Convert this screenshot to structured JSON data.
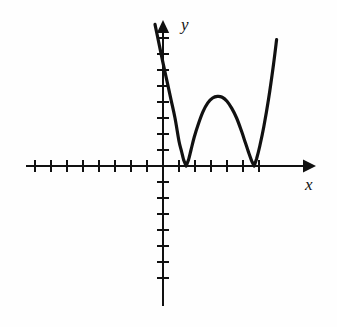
{
  "figure": {
    "title": "",
    "background_color": "#fefefe",
    "ink_color": "#111111",
    "width": 337,
    "height": 327
  },
  "labels": {
    "x_axis": "x",
    "y_axis": "y"
  },
  "axes": {
    "origin_px": {
      "x": 163,
      "y": 166
    },
    "tick_spacing_px": 16,
    "tick_half_length_px": 6,
    "x_axis": {
      "start_px": 26,
      "end_px": 312,
      "arrow": "right",
      "ticks_left_of_origin": 8,
      "ticks_right_of_origin": 6,
      "line_width_px": 2
    },
    "y_axis": {
      "top_px": 22,
      "bottom_px": 306,
      "arrow": "up",
      "ticks_above_origin": 8,
      "ticks_below_origin": 7,
      "line_width_px": 2
    }
  },
  "chart_data": {
    "type": "line",
    "title": "",
    "xlabel": "x",
    "ylabel": "y",
    "grid": false,
    "legend": null,
    "xlim": [
      -8.6,
      9.3
    ],
    "ylim": [
      -8.8,
      9.0
    ],
    "roots": [
      1.45,
      5.7
    ],
    "root_multiplicity": 2,
    "local_maximum": {
      "x": 3.7,
      "y": 4.3
    },
    "curve_line_width_px": 3.2,
    "series": [
      {
        "name": "f(x)",
        "x": [
          -0.5,
          -0.25,
          0.0,
          0.25,
          0.5,
          0.75,
          1.0,
          1.15,
          1.3,
          1.45,
          1.6,
          1.75,
          1.95,
          2.2,
          2.5,
          2.8,
          3.1,
          3.4,
          3.7,
          4.0,
          4.3,
          4.6,
          4.9,
          5.15,
          5.35,
          5.55,
          5.7,
          5.85,
          6.05,
          6.3,
          6.6,
          6.9,
          7.1
        ],
        "y": [
          8.85,
          7.65,
          6.45,
          5.3,
          4.15,
          3.0,
          1.55,
          0.95,
          0.35,
          0.0,
          0.4,
          1.0,
          1.8,
          2.6,
          3.4,
          3.95,
          4.25,
          4.35,
          4.3,
          4.05,
          3.6,
          3.0,
          2.2,
          1.45,
          0.85,
          0.3,
          0.0,
          0.45,
          1.25,
          2.45,
          4.2,
          6.3,
          7.9
        ]
      }
    ]
  },
  "curve_path": "M 155.2,25.0 L 161.0,44.0 L 166.0,60.0 L 170.5,76.0 L 175.0,92.5 L 179.0,107.5 L 183.0,125.0 L 184.8,135.0 L 186.0,147.0 L 186.9,166.0 L 188.5,159.5 L 190.8,150.0 L 194.5,137.5 L 199.5,124.5 L 205.5,112.5 L 211.5,103.5 L 217.5,98.0 L 223.5,96.0 L 229.5,97.0 L 235.5,101.0 L 241.0,108.5 L 246.0,118.5 L 250.5,130.5 L 254.5,142.5 L 257.5,152.5 L 260.0,161.5 L 261.6,166.0 L 263.5,158.5 L 266.5,146.0 L 270.0,128.0 L 274.5,101.0 L 279.0,68.0 L 281.5,44.0 L 283.0,28.0"
}
